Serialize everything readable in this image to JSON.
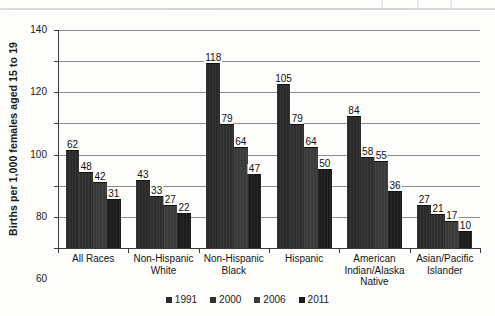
{
  "chart_data": {
    "type": "bar",
    "title": "",
    "subtitle": "",
    "xlabel": "",
    "ylabel": "Births per 1,000 females aged 15 to 19",
    "ylim": [
      0,
      140
    ],
    "ytick_step": 20,
    "yticks": [
      "140",
      "120",
      "100",
      "80",
      "60",
      "40",
      "20",
      "0"
    ],
    "grid": true,
    "legend_position": "bottom",
    "categories": [
      "All Races",
      "Non-Hispanic White",
      "Non-Hispanic Black",
      "Hispanic",
      "American Indian/Alaska Native",
      "Asian/Pacific Islander"
    ],
    "category_lines": [
      [
        "All Races"
      ],
      [
        "Non-Hispanic",
        "White"
      ],
      [
        "Non-Hispanic",
        "Black"
      ],
      [
        "Hispanic"
      ],
      [
        "American",
        "Indian/Alaska",
        "Native"
      ],
      [
        "Asian/Pacific",
        "Islander"
      ]
    ],
    "series": [
      {
        "name": "1991",
        "color": "#2a2a2a",
        "values": [
          62,
          43,
          118,
          105,
          84,
          27
        ]
      },
      {
        "name": "2000",
        "color": "#2f2f2f",
        "values": [
          48,
          33,
          79,
          79,
          58,
          21
        ]
      },
      {
        "name": "2006",
        "color": "#3a3a3a",
        "values": [
          42,
          27,
          64,
          64,
          55,
          17
        ]
      },
      {
        "name": "2011",
        "color": "#1c1c1c",
        "values": [
          31,
          22,
          47,
          50,
          36,
          10
        ]
      }
    ]
  },
  "legend": {
    "items": [
      {
        "label": "1991",
        "color": "#2a2a2a"
      },
      {
        "label": "2000",
        "color": "#2f2f2f"
      },
      {
        "label": "2006",
        "color": "#3a3a3a"
      },
      {
        "label": "2011",
        "color": "#1c1c1c"
      }
    ]
  }
}
